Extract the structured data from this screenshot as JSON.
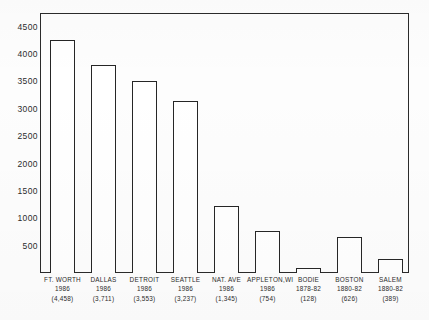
{
  "chart_data": {
    "type": "bar",
    "title": "",
    "subtitle": "",
    "xlabel": "",
    "ylabel": "",
    "ylim": [
      0,
      4750
    ],
    "grid": false,
    "legend": null,
    "orientation": "vertical",
    "bar_style": "outlined-white",
    "categories": [
      "FT. WORTH",
      "DALLAS",
      "DETROIT",
      "SEATTLE",
      "NAT. AVE",
      "APPLETON,WI",
      "BODIE",
      "BOSTON",
      "SALEM"
    ],
    "period_labels": [
      "1986",
      "1986",
      "1986",
      "1986",
      "1986",
      "1986",
      "1878-82",
      "1880-82",
      "1880-82"
    ],
    "value_labels": [
      "(4,458)",
      "(3,711)",
      "(3,553)",
      "(3,237)",
      "(1,345)",
      "(754)",
      "(128)",
      "(626)",
      "(389)"
    ],
    "labeled_values": [
      4458,
      3711,
      3553,
      3237,
      1345,
      754,
      128,
      626,
      389
    ],
    "values": [
      4260,
      3800,
      3500,
      3150,
      1230,
      760,
      95,
      650,
      250
    ],
    "yticks": [
      500,
      1000,
      1500,
      2000,
      2500,
      3000,
      3500,
      4000,
      4500
    ],
    "ytick_labels": [
      "500",
      "1000",
      "1500",
      "2000",
      "2500",
      "3000",
      "3500",
      "4000",
      "4500"
    ],
    "colors": {
      "bar_fill": "#ffffff",
      "bar_stroke": "#262626",
      "axis": "#2b2b2b",
      "text": "#2c2c2c",
      "background": "#fdfdfd"
    }
  },
  "axis": {
    "y_ticks": [
      "4500",
      "4000",
      "3500",
      "3000",
      "2500",
      "2000",
      "1500",
      "1000",
      "500"
    ]
  },
  "bars": [
    {
      "name": "FT. WORTH",
      "year": "1986",
      "value": "(4,458)"
    },
    {
      "name": "DALLAS",
      "year": "1986",
      "value": "(3,711)"
    },
    {
      "name": "DETROIT",
      "year": "1986",
      "value": "(3,553)"
    },
    {
      "name": "SEATTLE",
      "year": "1986",
      "value": "(3,237)"
    },
    {
      "name": "NAT. AVE",
      "year": "1986",
      "value": "(1,345)"
    },
    {
      "name": "APPLETON,WI",
      "year": "1986",
      "value": "(754)"
    },
    {
      "name": "BODIE",
      "year": "1878-82",
      "value": "(128)"
    },
    {
      "name": "BOSTON",
      "year": "1880-82",
      "value": "(626)"
    },
    {
      "name": "SALEM",
      "year": "1880-82",
      "value": "(389)"
    }
  ]
}
